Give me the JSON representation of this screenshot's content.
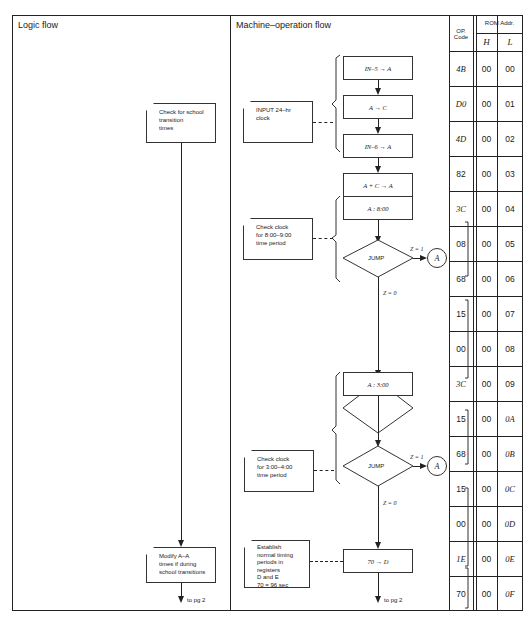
{
  "headers": {
    "logic_flow": "Logic flow",
    "machine_flow": "Machine–operation flow",
    "op_code_line1": "OP.",
    "op_code_line2": "Code",
    "rom_addr": "ROM Addr.",
    "h": "H",
    "l": "L"
  },
  "logic_flow": {
    "box1": [
      "Check for school",
      "transition",
      "times"
    ],
    "box2": [
      "Modify A–A",
      "times if during",
      "school transitions"
    ],
    "to_page": "to pg 2"
  },
  "machine_flow": {
    "steps": [
      "IN–5 → A",
      "A → C",
      "IN–6 → A",
      "A + C → A",
      "A : 8:00",
      "A : 3:00",
      "70 → D"
    ],
    "jump_label": "JUMP",
    "z1": "Z = 1",
    "z0": "Z = 0",
    "connector": "A",
    "notes": {
      "input_clock": [
        "INPUT 24–hr",
        "clock"
      ],
      "check_8": [
        "Check clock",
        "for 8:00–9:00",
        "time period"
      ],
      "check_3": [
        "Check clock",
        "for 3:00–4:00",
        "time period"
      ],
      "establish": [
        "Establish",
        "normal timing",
        "periods in registers",
        "D and E",
        "70 = 96 sec"
      ]
    },
    "to_page": "to pg 2"
  },
  "table": {
    "rows": [
      {
        "op": "4B",
        "h": "00",
        "l": "00"
      },
      {
        "op": "D0",
        "h": "00",
        "l": "01"
      },
      {
        "op": "4D",
        "h": "00",
        "l": "02"
      },
      {
        "op": "82",
        "h": "00",
        "l": "03"
      },
      {
        "op": "3C",
        "h": "00",
        "l": "04"
      },
      {
        "op": "08",
        "h": "00",
        "l": "05"
      },
      {
        "op": "68",
        "h": "00",
        "l": "06"
      },
      {
        "op": "15",
        "h": "00",
        "l": "07"
      },
      {
        "op": "00",
        "h": "00",
        "l": "08"
      },
      {
        "op": "3C",
        "h": "00",
        "l": "09"
      },
      {
        "op": "15",
        "h": "00",
        "l": "0A"
      },
      {
        "op": "68",
        "h": "00",
        "l": "0B"
      },
      {
        "op": "15",
        "h": "00",
        "l": "0C"
      },
      {
        "op": "00",
        "h": "00",
        "l": "0D"
      },
      {
        "op": "1E",
        "h": "00",
        "l": "0E"
      },
      {
        "op": "70",
        "h": "00",
        "l": "0F"
      }
    ]
  }
}
